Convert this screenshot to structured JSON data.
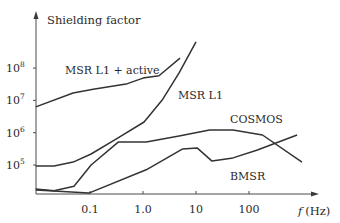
{
  "chart_data": {
    "type": "line",
    "title": "",
    "ylabel": "Shielding factor",
    "xlabel": "f (Hz)",
    "xlabel_italic_part": "f",
    "xlabel_unit_part": "(Hz)",
    "xscale": "log",
    "yscale": "log",
    "x_ticks": [
      {
        "value": 0.1,
        "label": "0.1"
      },
      {
        "value": 1.0,
        "label": "1.0"
      },
      {
        "value": 10,
        "label": "10"
      },
      {
        "value": 100,
        "label": "100"
      }
    ],
    "y_ticks": [
      {
        "value": 100000,
        "base": "10",
        "exp": "5"
      },
      {
        "value": 1000000,
        "base": "10",
        "exp": "6"
      },
      {
        "value": 10000000,
        "base": "10",
        "exp": "7"
      },
      {
        "value": 100000000,
        "base": "10",
        "exp": "8"
      }
    ],
    "xlim": [
      0.0095,
      1500
    ],
    "ylim": [
      10000,
      1000000000
    ],
    "grid": false,
    "legend": "inline labels",
    "series": [
      {
        "name": "MSR L1 + active",
        "label_pos": {
          "x": 65,
          "y": 74
        },
        "x": [
          0.0095,
          0.048,
          0.115,
          0.48,
          1.0,
          2.0,
          5.0
        ],
        "y": [
          6300000,
          17000000,
          22000000,
          32000000,
          49000000,
          58000000,
          204000000
        ]
      },
      {
        "name": "MSR L1",
        "label_pos": {
          "x": 178,
          "y": 99
        },
        "x": [
          0.0095,
          0.021,
          0.048,
          0.105,
          0.31,
          1.05,
          2.3,
          4.8,
          10
        ],
        "y": [
          93000,
          93000,
          123000,
          219000,
          630000,
          2140000,
          10200000,
          71000000,
          650000000
        ]
      },
      {
        "name": "COSMOS",
        "label_pos": {
          "x": 230,
          "y": 123
        },
        "x": [
          0.0095,
          0.021,
          0.05,
          0.105,
          0.34,
          1.15,
          4.8,
          18,
          50,
          180,
          1000
        ],
        "y": [
          18000,
          16000,
          22000,
          100000,
          510000,
          510000,
          790000,
          1200000,
          1200000,
          850000,
          123000
        ]
      },
      {
        "name": "BMSR",
        "label_pos": {
          "x": 230,
          "y": 180
        },
        "x": [
          0.0095,
          0.095,
          1.15,
          5.6,
          10.5,
          20,
          50,
          140,
          810
        ],
        "y": [
          17000,
          13500,
          71000,
          316000,
          339000,
          132000,
          166000,
          288000,
          850000
        ]
      }
    ]
  }
}
